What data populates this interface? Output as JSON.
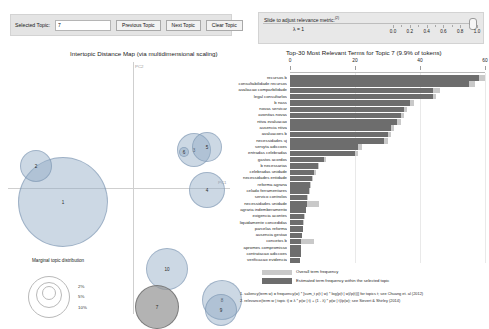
{
  "left_controls": {
    "selected_topic_label": "Selected Topic:",
    "selected_topic_value": "7",
    "previous_button": "Previous Topic",
    "next_button": "Next Topic",
    "clear_button": "Clear Topic"
  },
  "right_controls": {
    "slider_label": "Slide to adjust relevance metric:",
    "slider_label_sup": "(2)",
    "lambda_text": "λ = 1",
    "tick_labels": [
      "0.0",
      "0.2",
      "0.4",
      "0.6",
      "0.8",
      "1.0"
    ],
    "tick_values": [
      0.0,
      0.2,
      0.4,
      0.6,
      0.8,
      1.0
    ],
    "handle_value": 1.0
  },
  "left_panel": {
    "title": "Intertopic Distance Map (via multidimensional scaling)",
    "axis_x_label": "PC1",
    "axis_y_label": "PC2",
    "marginal_legend": {
      "title": "Marginal topic distribution",
      "sizes": [
        "2%",
        "5%",
        "10%"
      ]
    },
    "topics": [
      {
        "id": "1",
        "x": 55,
        "y": 140,
        "r": 45,
        "selected": false
      },
      {
        "id": "2",
        "x": 28,
        "y": 104,
        "r": 16,
        "selected": false
      },
      {
        "id": "3",
        "x": 186,
        "y": 88,
        "r": 17,
        "selected": false
      },
      {
        "id": "5",
        "x": 199,
        "y": 85,
        "r": 15,
        "selected": false
      },
      {
        "id": "6",
        "x": 176,
        "y": 90,
        "r": 5,
        "selected": false
      },
      {
        "id": "4",
        "x": 199,
        "y": 128,
        "r": 18,
        "selected": false
      },
      {
        "id": "10",
        "x": 159,
        "y": 207,
        "r": 21,
        "selected": false
      },
      {
        "id": "7",
        "x": 149,
        "y": 245,
        "r": 22,
        "selected": true
      },
      {
        "id": "8",
        "x": 214,
        "y": 238,
        "r": 20,
        "selected": false
      },
      {
        "id": "9",
        "x": 213,
        "y": 248,
        "r": 16,
        "selected": false
      }
    ]
  },
  "chart_data": {
    "type": "bar",
    "title": "Top-30 Most Relevant Terms for Topic 7 (9.9% of tokens)",
    "xlabel": "",
    "ylabel": "",
    "xlim": [
      0,
      60
    ],
    "xticks": [
      0,
      20,
      40,
      60
    ],
    "xtick_labels": [
      "0",
      "20",
      "40",
      "60"
    ],
    "grid": true,
    "legend_position": "bottom",
    "orientation": "horizontal",
    "series": [
      {
        "name": "Overall term frequency",
        "color": "#c9c9c9"
      },
      {
        "name": "Estimated term frequency within the selected topic",
        "color": "#6d6d6d"
      }
    ],
    "categories": [
      "recursos b",
      "consultabilidade recursos",
      "avaliacao comparbilidade",
      "legal consultarlos",
      "b nass",
      "novas servicar",
      "avonitas novas",
      "ntiva evaluacao",
      "ausencia ntiva",
      "avaluacoes b",
      "necessidades uj",
      "servyta adiccoes",
      "entradas celebradas",
      "gastos acordos",
      "b necessarias",
      "celebradas unidade",
      "necessidades entidade",
      "reforma agrana",
      "celado ferramentares",
      "servico controlos",
      "necessidades unidade",
      "agraria indemberamento",
      "exigencia acontes",
      "liquidamente concedidas",
      "parcelas reforma",
      "ausencia gestao",
      "concetos b",
      "apromes compromisso",
      "contratacao adiccoes",
      "verificacao evidencia"
    ],
    "overall": [
      60,
      57,
      46,
      45,
      38,
      36,
      35,
      34,
      32,
      31,
      30,
      22,
      21,
      11,
      9,
      8,
      7,
      6.5,
      6,
      5.5,
      9,
      5,
      4.5,
      4.2,
      4,
      3.8,
      7.5,
      3.5,
      3.4,
      3.2
    ],
    "estimated": [
      58,
      55,
      44,
      44,
      37,
      35,
      34,
      33,
      31,
      30,
      29,
      21,
      20,
      10.5,
      8.5,
      7.5,
      6.8,
      6.2,
      5.8,
      5.3,
      5.1,
      4.8,
      4.4,
      4.0,
      3.9,
      3.7,
      3.5,
      3.4,
      3.3,
      3.1
    ]
  },
  "bar_legend": {
    "overall": "Overall term frequency",
    "estimated": "Estimated term frequency within the selected topic"
  },
  "footnotes": [
    "1. saliency(term w) = frequency(w) * [sum_t p(t | w) * log(p(t | w)/p(t))] for topics t; see Chuang et. al (2012)",
    "2. relevance(term w | topic t) = λ * p(w | t) + (1 - λ) * p(w | t)/p(w); see Sievert & Shirley (2014)"
  ]
}
